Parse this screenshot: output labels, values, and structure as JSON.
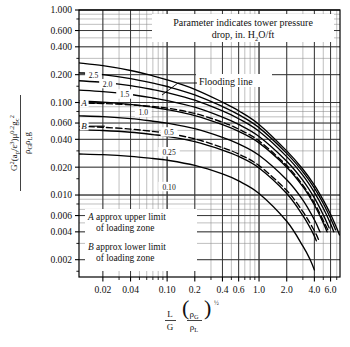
{
  "figure": {
    "background_color": "#ffffff",
    "line_color": "#000000",
    "grid_color": "#555555",
    "minor_grid_color": "#8a8a8a"
  },
  "annotations": {
    "parameter_note_line1": "Parameter indicates tower pressure",
    "parameter_note_line2_pre": "drop, in. H",
    "parameter_note_line2_sub": "2",
    "parameter_note_line2_post": "O/ft",
    "flooding_label": "Flooding line",
    "note_a_line1_italic": "A",
    "note_a_line1_rest": " approx upper limit",
    "note_a_line2": "of loading zone",
    "note_b_line1_italic": "B",
    "note_b_line1_rest": " approx lower limit",
    "note_b_line2": "of loading zone"
  },
  "axes": {
    "x_tick_labels": [
      "0.02",
      "0.04",
      "0.10",
      "0.2",
      "0.4",
      "0.6",
      "1.0",
      "2.0",
      "4.0",
      "6.0"
    ],
    "x_tick_values": [
      0.02,
      0.04,
      0.1,
      0.2,
      0.4,
      0.6,
      1.0,
      2.0,
      4.0,
      6.0
    ],
    "y_tick_labels": [
      "1.000",
      "0.600",
      "0.400",
      "0.200",
      "0.100",
      "0.060",
      "0.040",
      "0.020",
      "0.010",
      "0.006",
      "0.004",
      "0.002"
    ],
    "y_tick_values": [
      1.0,
      0.6,
      0.4,
      0.2,
      0.1,
      0.06,
      0.04,
      0.02,
      0.01,
      0.006,
      0.004,
      0.002
    ],
    "x_title": {
      "num": "L",
      "den": "G",
      "paren_num_base": "ρ",
      "paren_num_sub": "G",
      "paren_den_base": "ρ",
      "paren_den_sub": "L",
      "exponent": "½"
    },
    "y_title": {
      "num_main": "G",
      "num_sup1": "2",
      "num_paren": "(a",
      "num_paren_sub1": "p",
      "num_slash": "/ε",
      "num_sup2": "3",
      "num_close": ")μ",
      "num_sup3": "0.2",
      "num_gc": "g",
      "num_gc_sub": "c",
      "num_gc_sup": "2",
      "den_rho_g": "ρ",
      "den_rho_g_sub": "G",
      "den_rho_l": "ρ",
      "den_rho_l_sub": "L",
      "den_g": "g"
    }
  },
  "chart_data": {
    "type": "line",
    "title": "",
    "subtitle": "Parameter indicates tower pressure drop, in. H2O/ft",
    "xlabel": "L/G (rho_G/rho_L)^0.5",
    "ylabel": "G^2(a_p/eps^3)mu^0.2 g_c^2 / (rho_G rho_L g)",
    "xscale": "log",
    "yscale": "log",
    "xlim": [
      0.011,
      7.6
    ],
    "ylim": [
      0.0013,
      1.0
    ],
    "grid": true,
    "legend_position": "inline-curve-labels",
    "series": [
      {
        "name": "Flooding line",
        "label": "Flooding line",
        "style": "solid",
        "points": [
          [
            0.011,
            0.268
          ],
          [
            0.02,
            0.25
          ],
          [
            0.04,
            0.222
          ],
          [
            0.07,
            0.194
          ],
          [
            0.1,
            0.176
          ],
          [
            0.2,
            0.139
          ],
          [
            0.4,
            0.101
          ],
          [
            0.6,
            0.0815
          ],
          [
            1.0,
            0.058
          ],
          [
            2.0,
            0.03
          ],
          [
            3.0,
            0.019
          ],
          [
            4.0,
            0.0128
          ],
          [
            5.0,
            0.0088
          ],
          [
            6.0,
            0.0062
          ],
          [
            7.0,
            0.0044
          ],
          [
            7.5,
            0.0037
          ]
        ]
      },
      {
        "name": "2.5",
        "label": "2.5",
        "style": "solid",
        "points": [
          [
            0.011,
            0.21
          ],
          [
            0.02,
            0.2
          ],
          [
            0.04,
            0.181
          ],
          [
            0.07,
            0.162
          ],
          [
            0.1,
            0.149
          ],
          [
            0.2,
            0.121
          ],
          [
            0.4,
            0.0905
          ],
          [
            0.6,
            0.074
          ],
          [
            1.0,
            0.0535
          ],
          [
            2.0,
            0.0282
          ],
          [
            3.0,
            0.0178
          ],
          [
            4.0,
            0.0119
          ],
          [
            5.0,
            0.0081
          ],
          [
            6.0,
            0.0056
          ],
          [
            6.8,
            0.0042
          ]
        ]
      },
      {
        "name": "2.0",
        "label": "2.0",
        "style": "solid",
        "points": [
          [
            0.011,
            0.172
          ],
          [
            0.02,
            0.165
          ],
          [
            0.04,
            0.152
          ],
          [
            0.07,
            0.138
          ],
          [
            0.1,
            0.128
          ],
          [
            0.2,
            0.106
          ],
          [
            0.4,
            0.081
          ],
          [
            0.6,
            0.0668
          ],
          [
            1.0,
            0.0488
          ],
          [
            2.0,
            0.026
          ],
          [
            3.0,
            0.0163
          ],
          [
            4.0,
            0.0107
          ],
          [
            5.0,
            0.0072
          ],
          [
            6.0,
            0.0049
          ],
          [
            6.5,
            0.004
          ]
        ]
      },
      {
        "name": "1.5",
        "label": "1.5",
        "style": "solid",
        "points": [
          [
            0.011,
            0.136
          ],
          [
            0.02,
            0.131
          ],
          [
            0.04,
            0.122
          ],
          [
            0.07,
            0.112
          ],
          [
            0.1,
            0.105
          ],
          [
            0.2,
            0.089
          ],
          [
            0.4,
            0.0695
          ],
          [
            0.6,
            0.058
          ],
          [
            1.0,
            0.043
          ],
          [
            2.0,
            0.0232
          ],
          [
            3.0,
            0.0144
          ],
          [
            4.0,
            0.0093
          ],
          [
            5.0,
            0.0061
          ],
          [
            5.8,
            0.0044
          ]
        ]
      },
      {
        "name": "1.0",
        "label": "1.0",
        "style": "solid",
        "points": [
          [
            0.011,
            0.104
          ],
          [
            0.02,
            0.101
          ],
          [
            0.04,
            0.0953
          ],
          [
            0.07,
            0.0885
          ],
          [
            0.1,
            0.0838
          ],
          [
            0.2,
            0.0722
          ],
          [
            0.4,
            0.0576
          ],
          [
            0.6,
            0.0487
          ],
          [
            1.0,
            0.0366
          ],
          [
            2.0,
            0.02
          ],
          [
            3.0,
            0.0123
          ],
          [
            4.0,
            0.0078
          ],
          [
            5.0,
            0.005
          ],
          [
            5.5,
            0.004
          ]
        ]
      },
      {
        "name": "0.5",
        "label": "0.5",
        "style": "solid",
        "points": [
          [
            0.011,
            0.0718
          ],
          [
            0.02,
            0.0703
          ],
          [
            0.04,
            0.067
          ],
          [
            0.07,
            0.0628
          ],
          [
            0.1,
            0.0598
          ],
          [
            0.2,
            0.0521
          ],
          [
            0.4,
            0.042
          ],
          [
            0.6,
            0.0357
          ],
          [
            1.0,
            0.0269
          ],
          [
            2.0,
            0.0146
          ],
          [
            3.0,
            0.0088
          ],
          [
            4.0,
            0.0054
          ],
          [
            4.6,
            0.004
          ]
        ]
      },
      {
        "name": "0.25",
        "label": "0.25",
        "style": "solid",
        "points": [
          [
            0.011,
            0.0508
          ],
          [
            0.02,
            0.0498
          ],
          [
            0.04,
            0.0477
          ],
          [
            0.07,
            0.045
          ],
          [
            0.1,
            0.043
          ],
          [
            0.2,
            0.0377
          ],
          [
            0.4,
            0.0306
          ],
          [
            0.6,
            0.0261
          ],
          [
            1.0,
            0.0196
          ],
          [
            2.0,
            0.0104
          ],
          [
            3.0,
            0.006
          ],
          [
            3.8,
            0.004
          ],
          [
            4.2,
            0.0032
          ]
        ]
      },
      {
        "name": "0.10",
        "label": "0.10",
        "style": "solid",
        "points": [
          [
            0.011,
            0.0278
          ],
          [
            0.02,
            0.0273
          ],
          [
            0.04,
            0.0262
          ],
          [
            0.07,
            0.0248
          ],
          [
            0.1,
            0.0238
          ],
          [
            0.2,
            0.0209
          ],
          [
            0.4,
            0.0169
          ],
          [
            0.6,
            0.0142
          ],
          [
            1.0,
            0.0104
          ],
          [
            2.0,
            0.0052
          ],
          [
            3.0,
            0.0028
          ],
          [
            3.6,
            0.002
          ],
          [
            4.0,
            0.00155
          ]
        ]
      },
      {
        "name": "A",
        "label": "A",
        "style": "dashed",
        "description": "A approx upper limit of loading zone",
        "points": [
          [
            0.011,
            0.099
          ],
          [
            0.02,
            0.0975
          ],
          [
            0.04,
            0.0945
          ],
          [
            0.07,
            0.0905
          ],
          [
            0.1,
            0.087
          ],
          [
            0.2,
            0.0762
          ],
          [
            0.4,
            0.0612
          ],
          [
            0.6,
            0.0516
          ],
          [
            1.0,
            0.0385
          ],
          [
            2.0,
            0.0208
          ],
          [
            3.0,
            0.0128
          ],
          [
            4.0,
            0.0082
          ],
          [
            5.0,
            0.0053
          ],
          [
            5.6,
            0.0042
          ]
        ]
      },
      {
        "name": "B",
        "label": "B",
        "style": "dashed",
        "description": "B approx lower limit of loading zone",
        "points": [
          [
            0.011,
            0.0552
          ],
          [
            0.02,
            0.054
          ],
          [
            0.04,
            0.0516
          ],
          [
            0.07,
            0.0487
          ],
          [
            0.1,
            0.0465
          ],
          [
            0.2,
            0.0405
          ],
          [
            0.4,
            0.0326
          ],
          [
            0.6,
            0.0277
          ],
          [
            1.0,
            0.0208
          ],
          [
            2.0,
            0.0112
          ],
          [
            3.0,
            0.0066
          ],
          [
            4.0,
            0.0041
          ],
          [
            4.5,
            0.0032
          ]
        ]
      }
    ],
    "curve_labels": [
      {
        "text": "2.5",
        "x": 0.0158,
        "y": 0.196
      },
      {
        "text": "2.0",
        "x": 0.0225,
        "y": 0.158
      },
      {
        "text": "1.5",
        "x": 0.0345,
        "y": 0.122
      },
      {
        "text": "1.0",
        "x": 0.055,
        "y": 0.0775
      },
      {
        "text": "0.5",
        "x": 0.105,
        "y": 0.0475
      },
      {
        "text": "0.25",
        "x": 0.105,
        "y": 0.029
      },
      {
        "text": "0.10",
        "x": 0.105,
        "y": 0.0122
      },
      {
        "text": "A",
        "x": 0.0125,
        "y": 0.0985
      },
      {
        "text": "B",
        "x": 0.0125,
        "y": 0.0555
      }
    ]
  }
}
